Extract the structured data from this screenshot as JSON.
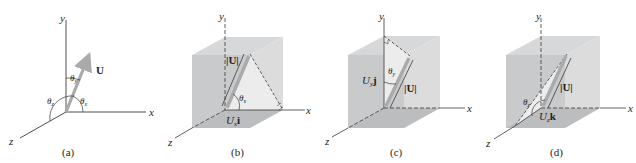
{
  "figure": {
    "panels": [
      {
        "id": "a",
        "caption": "(a)",
        "axes": {
          "x": "x",
          "y": "y",
          "z": "z"
        },
        "vector_label": "U",
        "angles": [
          "θx",
          "θy",
          "θz"
        ]
      },
      {
        "id": "b",
        "caption": "(b)",
        "axes": {
          "x": "x",
          "y": "y",
          "z": "z"
        },
        "magnitude_label": "|U|",
        "angle_label": "θx",
        "component_label_base": "U",
        "component_label_sub": "x",
        "component_label_unit": "i"
      },
      {
        "id": "c",
        "caption": "(c)",
        "axes": {
          "x": "x",
          "y": "y",
          "z": "z"
        },
        "magnitude_label": "|U|",
        "angle_label": "θy",
        "component_label_base": "U",
        "component_label_sub": "y",
        "component_label_unit": "j"
      },
      {
        "id": "d",
        "caption": "(d)",
        "axes": {
          "x": "x",
          "y": "y",
          "z": "z"
        },
        "magnitude_label": "|U|",
        "angle_label": "θz",
        "component_label_base": "U",
        "component_label_sub": "z",
        "component_label_unit": "k"
      }
    ],
    "colors": {
      "axis": "#3a3a3a",
      "vector": "#a9aaac",
      "cube_front": "#c9cacc",
      "cube_top": "#d7d8d9",
      "cube_side": "#dcdcdd",
      "cube_bottom": "#bcbdbf",
      "triangle": "#ececec",
      "text": "#231f20"
    }
  }
}
